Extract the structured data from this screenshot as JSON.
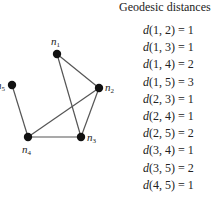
{
  "title": "Geodesic distances",
  "graph": {
    "nodes": [
      {
        "id": "n1",
        "label": "n",
        "sub": "1",
        "x": 57,
        "y": 54,
        "lx": 51,
        "ly": 45
      },
      {
        "id": "n2",
        "label": "n",
        "sub": "2",
        "x": 99,
        "y": 88,
        "lx": 105,
        "ly": 91
      },
      {
        "id": "n3",
        "label": "n",
        "sub": "3",
        "x": 81,
        "y": 137,
        "lx": 87,
        "ly": 141
      },
      {
        "id": "n4",
        "label": "n",
        "sub": "4",
        "x": 28,
        "y": 137,
        "lx": 22,
        "ly": 153
      },
      {
        "id": "n5",
        "label": "n",
        "sub": "5",
        "x": 12,
        "y": 85,
        "lx": -4,
        "ly": 89
      }
    ],
    "edges": [
      [
        "n1",
        "n2"
      ],
      [
        "n1",
        "n3"
      ],
      [
        "n2",
        "n3"
      ],
      [
        "n2",
        "n4"
      ],
      [
        "n3",
        "n4"
      ],
      [
        "n4",
        "n5"
      ]
    ],
    "node_color": "#111111",
    "edge_color": "#555555"
  },
  "distances": [
    {
      "pair": "1, 2",
      "value": "1"
    },
    {
      "pair": "1, 3",
      "value": "1"
    },
    {
      "pair": "1, 4",
      "value": "2"
    },
    {
      "pair": "1, 5",
      "value": "3"
    },
    {
      "pair": "2, 3",
      "value": "1"
    },
    {
      "pair": "2, 4",
      "value": "1"
    },
    {
      "pair": "2, 5",
      "value": "2"
    },
    {
      "pair": "3, 4",
      "value": "1"
    },
    {
      "pair": "3, 5",
      "value": "2"
    },
    {
      "pair": "4, 5",
      "value": "1"
    }
  ]
}
